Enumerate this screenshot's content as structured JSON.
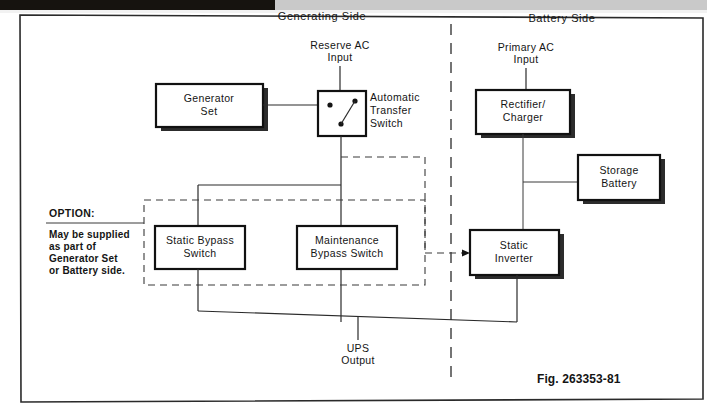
{
  "figure": {
    "caption": "Fig. 263353-81",
    "headers": {
      "left": "Generating Side",
      "right": "Battery Side"
    },
    "inputs": {
      "reserve_ac": "Reserve AC\nInput",
      "reserve_ac_line1": "Reserve AC",
      "reserve_ac_line2": "Input",
      "primary_ac_line1": "Primary AC",
      "primary_ac_line2": "Input"
    },
    "output": {
      "ups_line1": "UPS",
      "ups_line2": "Output"
    },
    "blocks": [
      {
        "id": "generator-set",
        "line1": "Generator",
        "line2": "Set",
        "shadow": true
      },
      {
        "id": "automatic-transfer-switch",
        "line1": "",
        "line2": "",
        "shadow": false
      },
      {
        "id": "rectifier-charger",
        "line1": "Rectifier/",
        "line2": "Charger",
        "shadow": true
      },
      {
        "id": "storage-battery",
        "line1": "Storage",
        "line2": "Battery",
        "shadow": true
      },
      {
        "id": "static-inverter",
        "line1": "Static",
        "line2": "Inverter",
        "shadow": true
      },
      {
        "id": "static-bypass-switch",
        "line1": "Static  Bypass",
        "line2": "Switch",
        "shadow": false
      },
      {
        "id": "maintenance-bypass-switch",
        "line1": "Maintenance",
        "line2": "Bypass  Switch",
        "shadow": false
      }
    ],
    "ats_label": {
      "line1": "Automatic",
      "line2": "Transfer",
      "line3": "Switch"
    },
    "option_note": {
      "title": "OPTION:",
      "line1": "May  be  supplied",
      "line2": "as  part  of",
      "line3": "Generator  Set",
      "line4": "or  Battery  side."
    },
    "colors": {
      "ink": "#141414",
      "line": "#2a2a2a",
      "box_stroke": "#111111",
      "box_fill": "#ffffff",
      "shadow": "#2c2c2c",
      "page_bg": "#ffffff",
      "scanbar_black": "#16130f",
      "scanbar_gray": "#c9c9c9"
    }
  }
}
